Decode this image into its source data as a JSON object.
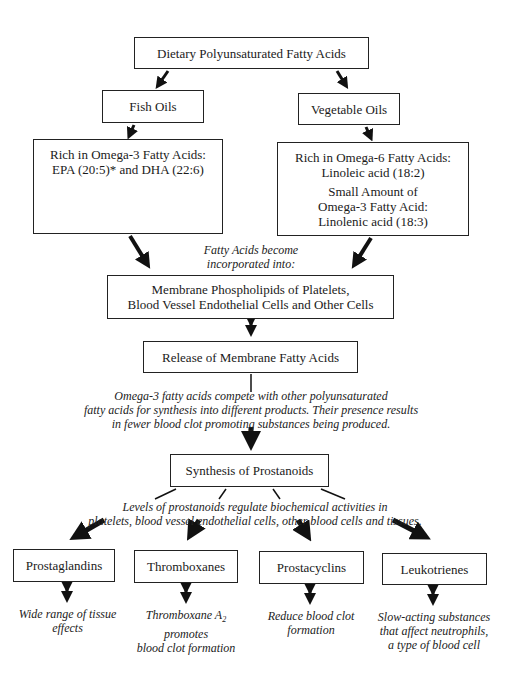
{
  "diagram": {
    "top": {
      "label": "Dietary Polyunsaturated Fatty Acids"
    },
    "fish_oils": {
      "label": "Fish Oils"
    },
    "vegetable_oils": {
      "label": "Vegetable Oils"
    },
    "omega3_box": {
      "lines": [
        "Rich in Omega-3 Fatty Acids:",
        "EPA (20:5)* and DHA (22:6)"
      ]
    },
    "omega6_box": {
      "lines": [
        "Rich in Omega-6 Fatty Acids:",
        "Linoleic acid (18:2)"
      ],
      "lines2": [
        "Small Amount of",
        "Omega-3 Fatty Acid:",
        "Linolenic acid (18:3)"
      ]
    },
    "incorporated_note": {
      "lines": [
        "Fatty Acids become",
        "incorporated into:"
      ]
    },
    "membrane_box": {
      "lines": [
        "Membrane Phospholipids of Platelets,",
        "Blood Vessel Endothelial Cells and Other Cells"
      ]
    },
    "release_box": {
      "label": "Release of Membrane Fatty Acids"
    },
    "compete_note": {
      "lines": [
        "Omega-3 fatty acids compete with other polyunsaturated",
        "fatty acids for synthesis into different products. Their presence results",
        "in fewer blood clot promoting substances being produced."
      ]
    },
    "synthesis_box": {
      "label": "Synthesis of Prostanoids"
    },
    "levels_note": {
      "lines": [
        "Levels of prostanoids regulate biochemical activities in",
        "platelets, blood vessel endothelial cells, other blood cells and tissues."
      ]
    },
    "outputs": [
      {
        "label": "Prostaglandins",
        "effect": [
          "Wide range of tissue",
          "effects"
        ]
      },
      {
        "label": "Thromboxanes",
        "effect_pre": "Thromboxane A",
        "effect_sub": "2",
        "effect": [
          "promotes",
          "blood clot formation"
        ]
      },
      {
        "label": "Prostacyclins",
        "effect": [
          "Reduce blood clot",
          "formation"
        ]
      },
      {
        "label": "Leukotrienes",
        "effect": [
          "Slow-acting substances",
          "that affect neutrophils,",
          "a type of blood cell"
        ]
      }
    ]
  }
}
